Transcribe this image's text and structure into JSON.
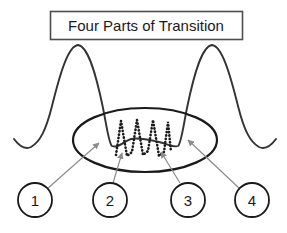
{
  "figure": {
    "title": "Four Parts of Transition",
    "background_color": "#ffffff",
    "stroke_color": "#1a1a1a",
    "leader_color": "#8c8c8c",
    "title_box": {
      "x": 50,
      "y": 11,
      "width": 193,
      "height": 29
    },
    "curve": {
      "description": "bimodal double-peak curve with central dip",
      "peaks": [
        {
          "label": "left-peak",
          "x": 78,
          "y": 45
        },
        {
          "label": "right-peak",
          "x": 212,
          "y": 45
        }
      ],
      "valleys": [
        {
          "label": "left-tail-valley",
          "x": 31,
          "y": 147
        },
        {
          "label": "center-left-valley",
          "x": 112,
          "y": 146
        },
        {
          "label": "center-right-valley",
          "x": 178,
          "y": 146
        },
        {
          "label": "right-tail-valley",
          "x": 259,
          "y": 147
        }
      ]
    },
    "oscillation": {
      "style": "dotted",
      "peak_count": 3,
      "x_start": 115,
      "x_end": 170,
      "y_top": 120,
      "y_bottom": 156
    },
    "ellipse": {
      "cx": 145,
      "cy": 140,
      "rx": 72,
      "ry": 32
    },
    "callouts": [
      {
        "label": "1",
        "cx": 35,
        "cy": 200,
        "r": 17,
        "target_x": 99,
        "target_y": 143
      },
      {
        "label": "2",
        "cx": 110,
        "cy": 200,
        "r": 17,
        "target_x": 122,
        "target_y": 153
      },
      {
        "label": "3",
        "cx": 188,
        "cy": 200,
        "r": 17,
        "target_x": 161,
        "target_y": 152
      },
      {
        "label": "4",
        "cx": 252,
        "cy": 200,
        "r": 17,
        "target_x": 188,
        "target_y": 140
      }
    ]
  }
}
